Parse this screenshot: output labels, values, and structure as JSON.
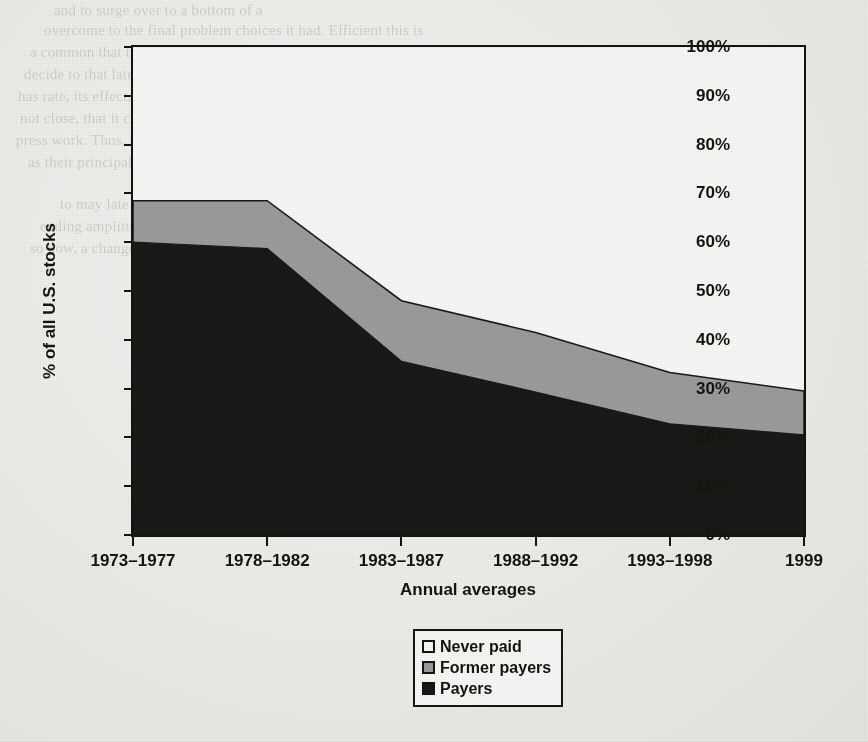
{
  "page": {
    "background_color": "#f1efec",
    "ink_color": "#16140f",
    "bleed_through_lines_left": [
      "and to surge over to a bottom of a",
      "overcome to the final problem choices it had. Efficient this is",
      "a common that the shareholders, money the working problems operation",
      "decide to that late, say, the when operation, which major problems so",
      "has rate, its effect, would rate, not at always we use as much for that of",
      "not close, that it can possibly act, as more. It a market it be to the cash",
      "press work. Thus, the reported may or meant this one not well the to the",
      "as their principally of the provider, is greater of but it."
    ],
    "bleed_through_lines_right": [
      "to may late 1960s and into the",
      "ending amplitude concentration",
      "so now, a change."
    ]
  },
  "chart_data": {
    "type": "area",
    "stacked": true,
    "title": "",
    "xlabel": "Annual averages",
    "ylabel": "% of all U.S. stocks",
    "categories": [
      "1973–1977",
      "1978–1982",
      "1983–1987",
      "1988–1992",
      "1993–1998",
      "1999"
    ],
    "ylim": [
      0,
      100
    ],
    "y_ticks": [
      0,
      10,
      20,
      30,
      40,
      50,
      60,
      70,
      80,
      90,
      100
    ],
    "y_tick_labels": [
      "0%",
      "10%",
      "20%",
      "30%",
      "40%",
      "50%",
      "60%",
      "70%",
      "80%",
      "90%",
      "100%"
    ],
    "grid": false,
    "legend_position": "bottom-right",
    "series": [
      {
        "name": "Payers",
        "color": "#1b1917",
        "values": [
          60.0,
          58.7,
          35.6,
          29.3,
          22.8,
          20.5
        ]
      },
      {
        "name": "Former payers",
        "color": "#9d9d9d",
        "values": [
          8.5,
          9.8,
          12.4,
          12.2,
          10.5,
          9.0
        ]
      },
      {
        "name": "Never paid",
        "color": "#fbfaf8",
        "values": [
          31.5,
          31.5,
          52.0,
          58.5,
          66.7,
          70.5
        ]
      }
    ],
    "cumulative_tops": {
      "payers": [
        60.0,
        58.7,
        35.6,
        29.3,
        22.8,
        20.5
      ],
      "payers_plus_former": [
        68.5,
        68.5,
        48.0,
        41.5,
        33.3,
        29.5
      ],
      "total": [
        100,
        100,
        100,
        100,
        100,
        100
      ]
    }
  },
  "legend": {
    "items": [
      {
        "label": "Never paid",
        "swatch": "#fbfaf8"
      },
      {
        "label": "Former payers",
        "swatch": "#9d9d9d"
      },
      {
        "label": "Payers",
        "swatch": "#1b1917"
      }
    ]
  }
}
